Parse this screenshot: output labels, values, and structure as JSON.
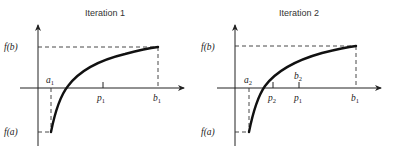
{
  "panels": [
    {
      "title": "Iteration 1",
      "y_labels": {
        "fb": "f(b)",
        "fa": "f(a)"
      },
      "x_labels": [
        {
          "base": "a",
          "sub": "1",
          "position": "above"
        },
        {
          "base": "p",
          "sub": "1",
          "position": "below"
        },
        {
          "base": "b",
          "sub": "1",
          "position": "below"
        }
      ]
    },
    {
      "title": "Iteration 2",
      "y_labels": {
        "fb": "f(b)",
        "fa": "f(a)"
      },
      "x_labels": [
        {
          "base": "a",
          "sub": "2",
          "position": "above"
        },
        {
          "base": "p",
          "sub": "2",
          "position": "below"
        },
        {
          "base": "b",
          "sub": "2",
          "position": "above"
        },
        {
          "base": "p",
          "sub": "1",
          "position": "below"
        },
        {
          "base": "b",
          "sub": "1",
          "position": "below"
        }
      ]
    }
  ]
}
